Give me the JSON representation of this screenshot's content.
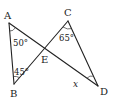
{
  "diagram": {
    "type": "geometry",
    "points": {
      "A": {
        "label": "A",
        "x": 9,
        "y": 23
      },
      "B": {
        "label": "B",
        "x": 14,
        "y": 84
      },
      "C": {
        "label": "C",
        "x": 68,
        "y": 21
      },
      "D": {
        "label": "D",
        "x": 98,
        "y": 86
      },
      "E": {
        "label": "E",
        "x": 45,
        "y": 49
      }
    },
    "segments": [
      "AB",
      "AD",
      "BC",
      "CD"
    ],
    "angles": {
      "A": {
        "label": "50°",
        "vertex": "A"
      },
      "B": {
        "label": "45°",
        "vertex": "B"
      },
      "C": {
        "label": "65°",
        "vertex": "C"
      },
      "D": {
        "label": "x",
        "vertex": "D"
      }
    }
  }
}
